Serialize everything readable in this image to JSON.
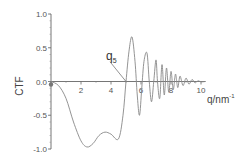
{
  "chart_data": {
    "type": "line",
    "title": "",
    "xlabel": "q/nm",
    "xlabel_superscript": "-1",
    "ylabel": "CTF",
    "xlim": [
      0,
      10.3
    ],
    "ylim": [
      -1.0,
      1.0
    ],
    "x_ticks": [
      0,
      2,
      4,
      6,
      8,
      10
    ],
    "x_tick_labels": [
      "0",
      "2",
      "4",
      "6",
      "8",
      "10"
    ],
    "y_ticks": [
      1.0,
      0.5,
      0.0,
      -0.5,
      -1.0
    ],
    "y_tick_labels": [
      "1.0",
      "0.5",
      "0.0",
      "-0.5",
      "-1.0"
    ],
    "grid": false,
    "legend": "none",
    "line_color": "#888888",
    "annotation": {
      "text": "q",
      "subscript": "5",
      "points_to": [
        5.0,
        0.0
      ],
      "text_at": [
        3.8,
        0.5
      ]
    },
    "series": [
      {
        "name": "CTF",
        "key_points": [
          [
            0.0,
            0.0
          ],
          [
            0.5,
            -0.06
          ],
          [
            1.0,
            -0.25
          ],
          [
            1.5,
            -0.6
          ],
          [
            2.0,
            -0.88
          ],
          [
            2.4,
            -0.97
          ],
          [
            2.8,
            -0.92
          ],
          [
            3.2,
            -0.8
          ],
          [
            3.6,
            -0.75
          ],
          [
            4.0,
            -0.78
          ],
          [
            4.5,
            -0.85
          ],
          [
            4.8,
            -0.5
          ],
          [
            5.0,
            0.0
          ],
          [
            5.2,
            0.45
          ],
          [
            5.4,
            0.66
          ],
          [
            5.6,
            0.3
          ],
          [
            5.75,
            -0.2
          ],
          [
            5.9,
            -0.5
          ],
          [
            6.05,
            -0.1
          ],
          [
            6.2,
            0.3
          ],
          [
            6.4,
            0.42
          ],
          [
            6.55,
            0.0
          ],
          [
            6.7,
            -0.3
          ],
          [
            6.85,
            0.0
          ],
          [
            7.0,
            0.32
          ],
          [
            7.1,
            0.0
          ],
          [
            7.25,
            -0.25
          ],
          [
            7.4,
            0.25
          ],
          [
            7.55,
            -0.2
          ],
          [
            7.7,
            0.2
          ],
          [
            7.85,
            -0.16
          ],
          [
            8.0,
            0.15
          ],
          [
            8.15,
            -0.12
          ],
          [
            8.3,
            0.11
          ],
          [
            8.45,
            -0.09
          ],
          [
            8.6,
            0.08
          ],
          [
            8.8,
            -0.06
          ],
          [
            9.0,
            0.05
          ],
          [
            9.2,
            -0.04
          ],
          [
            9.4,
            0.03
          ],
          [
            9.6,
            -0.02
          ],
          [
            9.8,
            0.01
          ],
          [
            10.0,
            -0.005
          ],
          [
            10.3,
            0.0
          ]
        ]
      }
    ]
  }
}
